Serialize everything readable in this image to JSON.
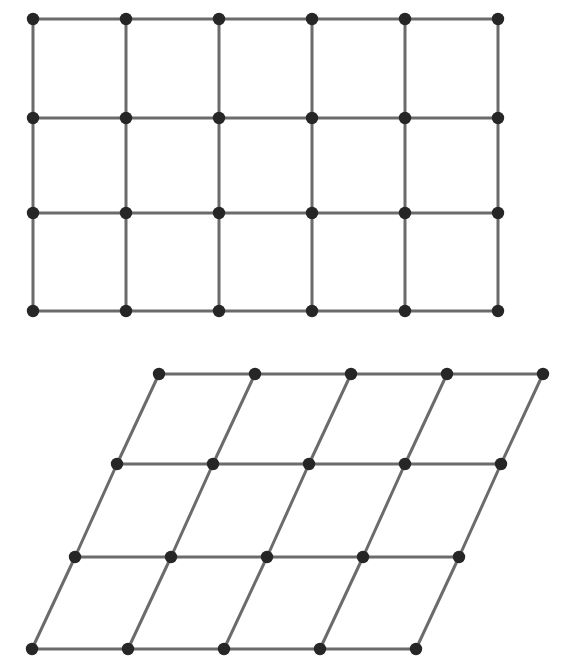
{
  "figure": {
    "background_color": "#ffffff",
    "edge_color": "#6b6b6b",
    "edge_width": 3,
    "node_color": "#262626",
    "node_radius": 6.2,
    "panels": [
      {
        "name": "rectangular-lattice",
        "label": "rectangular point lattice",
        "lattice_type": "rectangular",
        "columns": 6,
        "rows": 4,
        "col_spacing": 93,
        "row_spacing_list": [
          99,
          95,
          98
        ],
        "shear_per_row": 0,
        "origin": {
          "x": 33,
          "y": 19
        },
        "node_xs": [
          33,
          126,
          219,
          312,
          405,
          498
        ],
        "node_ys": [
          19,
          118,
          213,
          311
        ],
        "node_count": 24
      },
      {
        "name": "oblique-lattice",
        "label": "sheared (oblique) point lattice",
        "lattice_type": "oblique",
        "columns": 5,
        "rows": 4,
        "col_spacing": 96,
        "row_spacing_list": [
          90,
          93,
          92
        ],
        "shear_per_row": -42,
        "origin": {
          "x": 159,
          "y": 374
        },
        "row_origins_x": [
          159,
          117,
          75,
          32
        ],
        "node_ys": [
          374,
          464,
          557,
          649
        ],
        "node_count": 20
      }
    ]
  },
  "chart_data": {
    "type": "scatter",
    "xlabel": "",
    "ylabel": "",
    "grid": true,
    "legend": "none",
    "xlim": [
      0,
      570
    ],
    "ylim": [
      670,
      0
    ],
    "series": [
      {
        "name": "rectangular-lattice",
        "points": [
          [
            33,
            19
          ],
          [
            126,
            19
          ],
          [
            219,
            19
          ],
          [
            312,
            19
          ],
          [
            405,
            19
          ],
          [
            498,
            19
          ],
          [
            33,
            118
          ],
          [
            126,
            118
          ],
          [
            219,
            118
          ],
          [
            312,
            118
          ],
          [
            405,
            118
          ],
          [
            498,
            118
          ],
          [
            33,
            213
          ],
          [
            126,
            213
          ],
          [
            219,
            213
          ],
          [
            312,
            213
          ],
          [
            405,
            213
          ],
          [
            498,
            213
          ],
          [
            33,
            311
          ],
          [
            126,
            311
          ],
          [
            219,
            311
          ],
          [
            312,
            311
          ],
          [
            405,
            311
          ],
          [
            498,
            311
          ]
        ]
      },
      {
        "name": "oblique-lattice",
        "points": [
          [
            159,
            374
          ],
          [
            255,
            374
          ],
          [
            351,
            374
          ],
          [
            447,
            374
          ],
          [
            543,
            374
          ],
          [
            117,
            464
          ],
          [
            213,
            464
          ],
          [
            309,
            464
          ],
          [
            405,
            464
          ],
          [
            501,
            464
          ],
          [
            75,
            557
          ],
          [
            171,
            557
          ],
          [
            267,
            557
          ],
          [
            363,
            557
          ],
          [
            459,
            557
          ],
          [
            32,
            649
          ],
          [
            128,
            649
          ],
          [
            224,
            649
          ],
          [
            320,
            649
          ],
          [
            416,
            649
          ]
        ]
      }
    ]
  }
}
